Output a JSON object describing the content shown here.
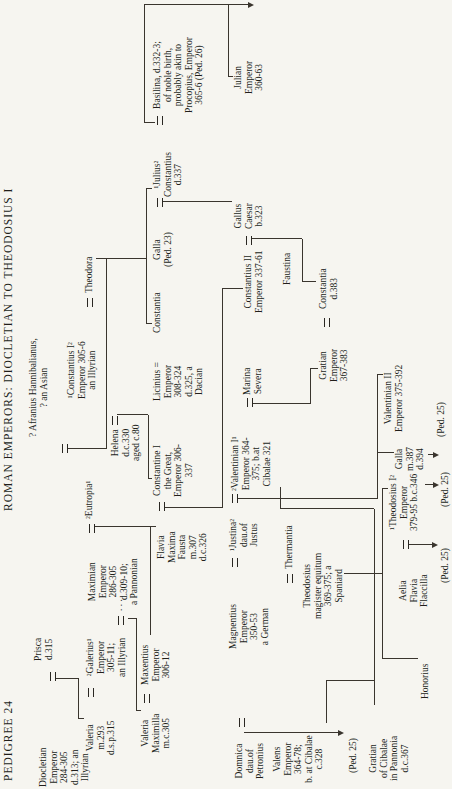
{
  "title": {
    "left": "PEDIGREE 24",
    "right": "ROMAN EMPERORS: DIOCLETIAN TO THEODOSIUS I"
  },
  "people": {
    "diocletian": {
      "lines": [
        "Diocletian",
        "Emperor",
        "284-305",
        "d.313; an",
        "Illyrian"
      ]
    },
    "prisca": {
      "lines": [
        "Prisca",
        "d.315"
      ]
    },
    "valeria": {
      "lines": [
        "Valeria",
        "m.293",
        "d.s.p.315"
      ]
    },
    "galerius": {
      "lines": [
        "²Galerius¹",
        "Emperor",
        "305-11;",
        "an Illyrian"
      ]
    },
    "valeria_maximilla": {
      "lines": [
        "Valeria",
        "Maximilla",
        "m.c.305"
      ]
    },
    "maxentius": {
      "lines": [
        "Maxentius",
        "Emperor",
        "306-12"
      ]
    },
    "maximian": {
      "lines": [
        "Maximian",
        "Emperor",
        "286-305",
        "d.309-10;",
        "a Pannonian"
      ]
    },
    "eutropia": {
      "lines": [
        "²Eutropia¹"
      ]
    },
    "afranius": {
      "lines": [
        "? Afranius Hannibalianus,",
        "? an Asian"
      ]
    },
    "fausta": {
      "lines": [
        "Flavia",
        "Maxima",
        "Fausta",
        "m.307",
        "d.c.326"
      ]
    },
    "constantine1": {
      "lines": [
        "Constantine I",
        "the Great,",
        "Emperor 306-",
        "337"
      ]
    },
    "constantius1": {
      "lines": [
        "¹Constantius I²",
        "Emperor 305-6",
        "an Illyrian"
      ]
    },
    "helena": {
      "lines": [
        "Helena",
        "d.c.330",
        "aged c.80"
      ]
    },
    "theodora": {
      "lines": [
        "Theodora"
      ]
    },
    "licinius": {
      "lines": [
        "Licinius =",
        "Emperor",
        "308-324",
        "d.325, a",
        "Dacian"
      ]
    },
    "constantia": {
      "lines": [
        "Constantia"
      ]
    },
    "galla_ped23": {
      "lines": [
        "Galla",
        "(Ped. 23)"
      ]
    },
    "julius": {
      "lines": [
        "¹Julius²",
        "Constantius",
        "d.337"
      ]
    },
    "basilina": {
      "lines": [
        "Basilina, d.332-3;",
        "of noble birth,",
        "probably akin to",
        "Procopius, Emperor",
        "365-6 (Ped. 26)"
      ]
    },
    "gallus": {
      "lines": [
        "Gallus",
        "Caesar",
        "b.323"
      ]
    },
    "julian": {
      "lines": [
        "Julian",
        "Emperor",
        "360-63"
      ]
    },
    "constantius2": {
      "lines": [
        "Constantius II",
        "Emperor 337-61"
      ]
    },
    "faustina": {
      "lines": [
        "Faustina"
      ]
    },
    "gratian_emperor": {
      "lines": [
        "Gratian",
        "Emperor",
        "367-383"
      ]
    },
    "constantia_d383": {
      "lines": [
        "Constantia",
        "d.383"
      ]
    },
    "magnentius": {
      "lines": [
        "Magnentius",
        "Emperor",
        "350-53",
        "a German"
      ]
    },
    "justina": {
      "lines": [
        "¹Justina²",
        "dau.of",
        "Justus"
      ]
    },
    "valentinian1": {
      "lines": [
        "²Valentinian I¹",
        "Emperor 364-",
        "375; b.at",
        "Cibalae 321"
      ]
    },
    "marina_severa": {
      "lines": [
        "Marina",
        "Severa"
      ]
    },
    "valentinian2": {
      "lines": [
        "Valentinian II",
        "Emperor 375-392"
      ]
    },
    "galla_387": {
      "lines": [
        "Galla",
        "m.387",
        "d.394"
      ]
    },
    "domnica": {
      "lines": [
        "Domnica",
        "dau.of",
        "Petronius"
      ]
    },
    "valens": {
      "lines": [
        "Valens",
        "Emperor",
        "364-78;",
        "b. at Cibalae",
        "c.328"
      ]
    },
    "gratian_cibalae": {
      "lines": [
        "Gratian",
        "of Cibalae",
        "in Pannonia",
        "d.c.367"
      ]
    },
    "thermantia": {
      "lines": [
        "Thermantia"
      ]
    },
    "theodosius_magister": {
      "lines": [
        "Theodosius",
        "magister equitum",
        "369-375; a",
        "Spaniard"
      ]
    },
    "honorius": {
      "lines": [
        "Honorius"
      ]
    },
    "flaccilla": {
      "lines": [
        "Aelia",
        "Flavia",
        "Flaccilla"
      ]
    },
    "theodosius1": {
      "lines": [
        "¹Theodosius I²",
        "Emperor",
        "379-95 b.c.346"
      ]
    }
  },
  "labels": {
    "ped25_valens": "(Ped. 25)",
    "ped25_flaccilla": "(Ped. 25)",
    "ped25_theodosius": "(Ped. 25)",
    "ped25_galla": "(Ped. 25)",
    "unknown_wife_dots": ". . ."
  },
  "colors": {
    "ink": "#211e1a",
    "paper": "#f6f5f0",
    "line": "#3a352e"
  }
}
